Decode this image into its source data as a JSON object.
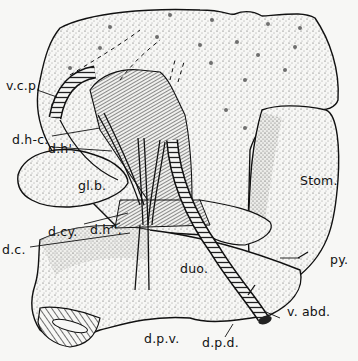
{
  "figure": {
    "type": "anatomical illustration",
    "style": "pen-and-ink stipple drawing",
    "colors": {
      "ink": "#111111",
      "paper": "#f7f7f5"
    }
  },
  "labels": {
    "vcp": "v.c.p.",
    "dhc": "d.h-c.",
    "dh1": "d.h'.",
    "glb": "gl.b.",
    "dcy": "d.cy.",
    "dh2": "d.h''.",
    "dc": "d.c.",
    "stom": "Stom.",
    "py": "py.",
    "duo": "duo.",
    "vabd": "v. abd.",
    "dpv": "d.p.v.",
    "dpd": "d.p.d."
  }
}
